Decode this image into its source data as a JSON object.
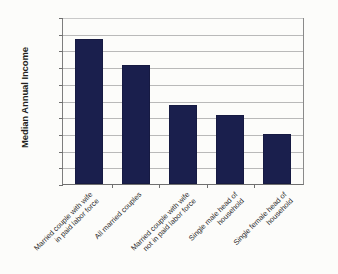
{
  "chart_data": {
    "type": "bar",
    "title": "",
    "xlabel": "",
    "ylabel": "Median Annual Income",
    "ylim": [
      0,
      100000
    ],
    "grid": true,
    "legend": "none",
    "categories": [
      "Married couple with wife in paid labor force",
      "All married couples",
      "Married couple with wife not in paid labor force",
      "Single male head of household",
      "Single female head of household"
    ],
    "category_lines": [
      [
        "Married couple with wife",
        "in paid labor force"
      ],
      [
        "All married couples",
        ""
      ],
      [
        "Married couple with wife",
        "not in paid labor force"
      ],
      [
        "Single male head of",
        "household"
      ],
      [
        "Single female head of",
        "household"
      ]
    ],
    "values": [
      86800,
      71200,
      47400,
      41200,
      29700
    ],
    "y_ticks": [
      10000,
      20000,
      30000,
      40000,
      50000,
      60000,
      70000,
      80000,
      90000,
      100000
    ],
    "y_tick_labels": [
      "$10,000",
      "$20,000",
      "$30,000",
      "$40,000",
      "$50,000",
      "$60,000",
      "$70,000",
      "$80,000",
      "$90,000",
      "$100,000"
    ],
    "bar_color": "#1a1f4d",
    "gridline_color": "#b9b9b9",
    "axis_color": "#6f6f6f"
  }
}
